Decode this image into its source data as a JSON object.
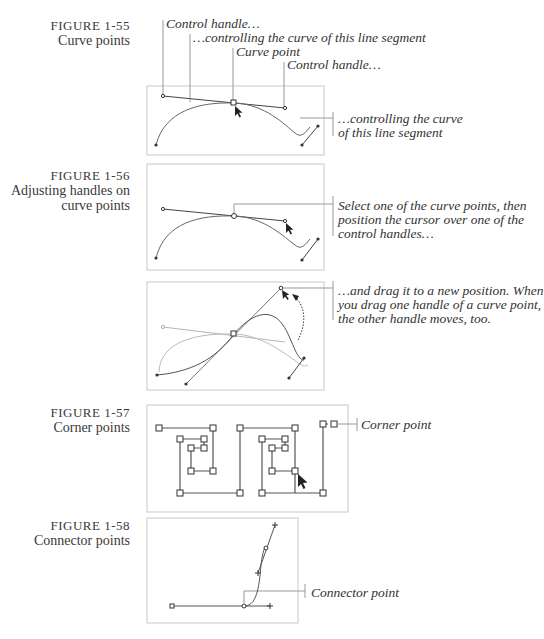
{
  "figures": [
    {
      "number": "FIGURE 1-55",
      "caption": [
        "Curve points"
      ],
      "callouts": [
        "Control handle…",
        "…controlling the curve of this line segment",
        "Curve point",
        "Control handle…",
        "…controlling the curve",
        "of this line segment"
      ]
    },
    {
      "number": "FIGURE 1-56",
      "caption": [
        "Adjusting handles on",
        "curve points"
      ],
      "callouts": [
        "Select one of the curve points, then",
        "position the cursor over one of the",
        "control handles…",
        "…and drag it to a new position. When",
        "you drag one handle of a curve point,",
        "the other handle moves, too."
      ]
    },
    {
      "number": "FIGURE 1-57",
      "caption": [
        "Corner points"
      ],
      "callouts": [
        "Corner point"
      ]
    },
    {
      "number": "FIGURE 1-58",
      "caption": [
        "Connector points"
      ],
      "callouts": [
        "Connector point"
      ]
    }
  ],
  "colors": {
    "box": "#c8c8c8",
    "line": "#555555",
    "ghost": "#b0b0b0",
    "text": "#333333"
  }
}
